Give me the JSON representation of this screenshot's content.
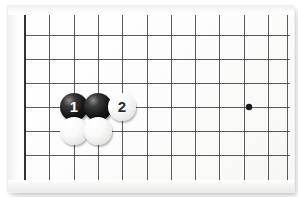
{
  "diagram": {
    "kind": "go-board-diagram",
    "board": {
      "background_color": "#fdfdfc",
      "line_color": "#4a4a4a",
      "thick_line_color": "#333333",
      "star_point_color": "#1a1a1a",
      "grid_spacing_px": 24,
      "edge_left_x": 25,
      "edge_bottom_y": 182,
      "vertical_line_x": [
        25,
        49,
        74,
        98,
        122,
        147,
        171,
        195,
        219,
        244,
        268,
        287
      ],
      "horizontal_line_y": [
        11,
        35,
        59,
        83,
        107,
        131,
        155,
        182
      ],
      "star_points": [
        {
          "name": "hoshi",
          "x": 249,
          "y": 107,
          "radius": 3.2
        }
      ]
    },
    "stones": [
      {
        "name": "black-stone-1",
        "color": "black",
        "label": "1",
        "x": 74,
        "y": 107
      },
      {
        "name": "black-stone-unnumbered",
        "color": "black",
        "label": "",
        "x": 98,
        "y": 107
      },
      {
        "name": "white-stone-2",
        "color": "white",
        "label": "2",
        "x": 122,
        "y": 107
      },
      {
        "name": "white-stone-left",
        "color": "white",
        "label": "",
        "x": 74,
        "y": 131
      },
      {
        "name": "white-stone-right",
        "color": "white",
        "label": "",
        "x": 98,
        "y": 131
      }
    ]
  }
}
